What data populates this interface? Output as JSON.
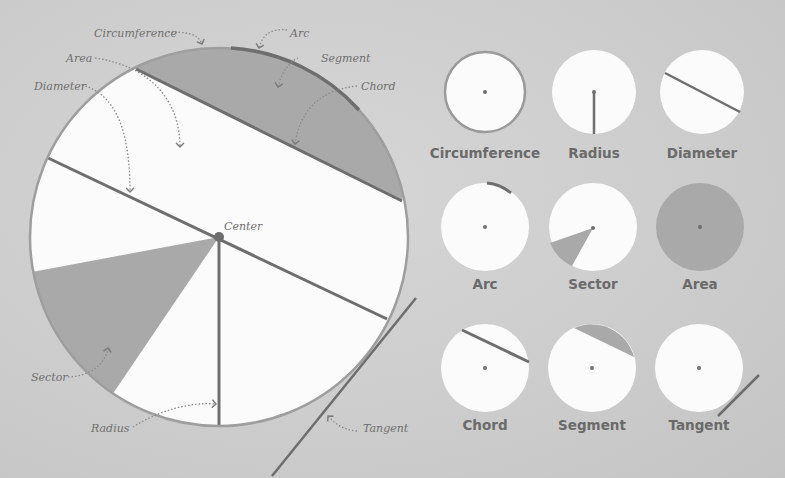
{
  "colors": {
    "background": "#cfcfcf",
    "circle_fill": "#fbfbfb",
    "shade": "#a9a9a9",
    "line": "#6e6e6e",
    "outline": "#9e9e9e",
    "text": "#6f6f6f"
  },
  "main_diagram": {
    "callouts": {
      "circumference": "Circumference",
      "arc": "Arc",
      "area": "Area",
      "segment": "Segment",
      "diameter": "Diameter",
      "chord": "Chord",
      "center": "Center",
      "sector": "Sector",
      "radius": "Radius",
      "tangent": "Tangent"
    }
  },
  "thumbnails": [
    {
      "label": "Circumference",
      "icon": "circumference-icon"
    },
    {
      "label": "Radius",
      "icon": "radius-icon"
    },
    {
      "label": "Diameter",
      "icon": "diameter-icon"
    },
    {
      "label": "Arc",
      "icon": "arc-icon"
    },
    {
      "label": "Sector",
      "icon": "sector-icon"
    },
    {
      "label": "Area",
      "icon": "area-icon"
    },
    {
      "label": "Chord",
      "icon": "chord-icon"
    },
    {
      "label": "Segment",
      "icon": "segment-icon"
    },
    {
      "label": "Tangent",
      "icon": "tangent-icon"
    }
  ]
}
